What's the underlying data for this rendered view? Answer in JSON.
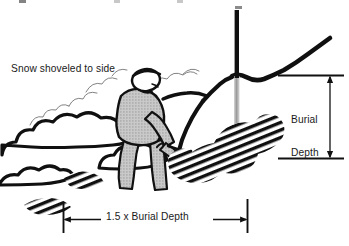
{
  "figure": {
    "background_color": "#ffffff",
    "ink_color": "#111111",
    "fill_gray": "#b3b3b3",
    "probe_gray": "#b9b9b9",
    "width_px": 349,
    "height_px": 246
  },
  "labels": {
    "snow_shoveled": "Snow shoveled to side",
    "burial_depth_line1": "Burial",
    "burial_depth_line2": "Depth",
    "width_dimension": "1.5 x Burial Depth"
  },
  "elements": {
    "snow_surface": "snow-surface-line",
    "probe": "probe-pole",
    "shoveler": "person-shoveling",
    "shovel": "shovel",
    "snow_piles": "shoveled-snow-piles",
    "excavation_pit": "excavation-pit-wall",
    "buried_object": "hatched-buried-debris"
  },
  "dimensions": {
    "vertical": {
      "name": "burial-depth-dimension",
      "label": "Burial Depth",
      "arrow_style": "double-headed",
      "x_px": 330,
      "top_y_px": 75,
      "bottom_y_px": 158
    },
    "horizontal": {
      "name": "excavation-width-dimension",
      "label": "1.5 x Burial Depth",
      "arrow_style": "double-headed",
      "y_px": 219,
      "left_x_px": 63,
      "right_x_px": 247
    }
  }
}
